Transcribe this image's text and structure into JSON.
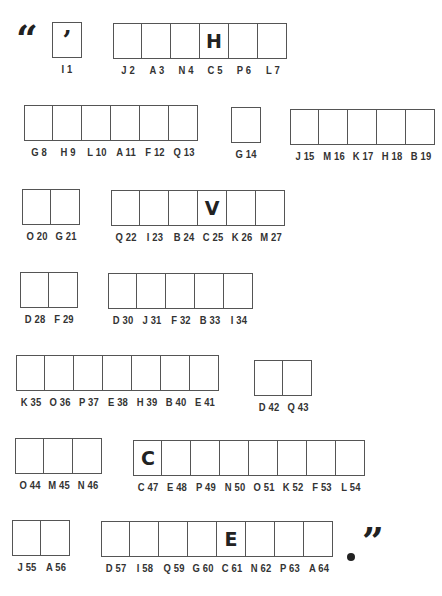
{
  "puzzle": {
    "open_quote": "“",
    "close_quote": "”",
    "end_punct": ".",
    "words": [
      {
        "x": 52,
        "y": 22,
        "cells": [
          {
            "label": "I 1",
            "value": "’",
            "kind": "apos"
          }
        ]
      },
      {
        "x": 113,
        "y": 23,
        "cells": [
          {
            "label": "J 2",
            "value": ""
          },
          {
            "label": "A 3",
            "value": ""
          },
          {
            "label": "N 4",
            "value": ""
          },
          {
            "label": "C 5",
            "value": "H"
          },
          {
            "label": "P 6",
            "value": ""
          },
          {
            "label": "L 7",
            "value": ""
          }
        ]
      },
      {
        "x": 24,
        "y": 105,
        "cells": [
          {
            "label": "G 8",
            "value": ""
          },
          {
            "label": "H 9",
            "value": ""
          },
          {
            "label": "L 10",
            "value": ""
          },
          {
            "label": "A 11",
            "value": ""
          },
          {
            "label": "F 12",
            "value": ""
          },
          {
            "label": "Q 13",
            "value": ""
          }
        ]
      },
      {
        "x": 231,
        "y": 107,
        "cells": [
          {
            "label": "G 14",
            "value": ""
          }
        ]
      },
      {
        "x": 290,
        "y": 109,
        "cells": [
          {
            "label": "J 15",
            "value": ""
          },
          {
            "label": "M 16",
            "value": ""
          },
          {
            "label": "K 17",
            "value": ""
          },
          {
            "label": "H 18",
            "value": ""
          },
          {
            "label": "B 19",
            "value": ""
          }
        ]
      },
      {
        "x": 22,
        "y": 189,
        "cells": [
          {
            "label": "O 20",
            "value": ""
          },
          {
            "label": "G 21",
            "value": ""
          }
        ]
      },
      {
        "x": 111,
        "y": 190,
        "cells": [
          {
            "label": "Q 22",
            "value": ""
          },
          {
            "label": "I 23",
            "value": ""
          },
          {
            "label": "B 24",
            "value": ""
          },
          {
            "label": "C 25",
            "value": "V"
          },
          {
            "label": "K 26",
            "value": ""
          },
          {
            "label": "M 27",
            "value": ""
          }
        ]
      },
      {
        "x": 20,
        "y": 272,
        "cells": [
          {
            "label": "D 28",
            "value": ""
          },
          {
            "label": "F 29",
            "value": ""
          }
        ]
      },
      {
        "x": 108,
        "y": 273,
        "cells": [
          {
            "label": "D 30",
            "value": ""
          },
          {
            "label": "J 31",
            "value": ""
          },
          {
            "label": "F 32",
            "value": ""
          },
          {
            "label": "B 33",
            "value": ""
          },
          {
            "label": "I 34",
            "value": ""
          }
        ]
      },
      {
        "x": 16,
        "y": 355,
        "cells": [
          {
            "label": "K 35",
            "value": ""
          },
          {
            "label": "O 36",
            "value": ""
          },
          {
            "label": "P 37",
            "value": ""
          },
          {
            "label": "E 38",
            "value": ""
          },
          {
            "label": "H 39",
            "value": ""
          },
          {
            "label": "B 40",
            "value": ""
          },
          {
            "label": "E 41",
            "value": ""
          }
        ]
      },
      {
        "x": 254,
        "y": 360,
        "cells": [
          {
            "label": "D 42",
            "value": ""
          },
          {
            "label": "Q 43",
            "value": ""
          }
        ]
      },
      {
        "x": 15,
        "y": 438,
        "cells": [
          {
            "label": "O 44",
            "value": ""
          },
          {
            "label": "M 45",
            "value": ""
          },
          {
            "label": "N 46",
            "value": ""
          }
        ]
      },
      {
        "x": 133,
        "y": 440,
        "cells": [
          {
            "label": "C 47",
            "value": "C"
          },
          {
            "label": "E 48",
            "value": ""
          },
          {
            "label": "P 49",
            "value": ""
          },
          {
            "label": "N 50",
            "value": ""
          },
          {
            "label": "O 51",
            "value": ""
          },
          {
            "label": "K 52",
            "value": ""
          },
          {
            "label": "F 53",
            "value": ""
          },
          {
            "label": "L 54",
            "value": ""
          }
        ]
      },
      {
        "x": 12,
        "y": 520,
        "cells": [
          {
            "label": "J 55",
            "value": ""
          },
          {
            "label": "A 56",
            "value": ""
          }
        ]
      },
      {
        "x": 101,
        "y": 521,
        "cells": [
          {
            "label": "D 57",
            "value": ""
          },
          {
            "label": "I 58",
            "value": ""
          },
          {
            "label": "Q 59",
            "value": ""
          },
          {
            "label": "G 60",
            "value": ""
          },
          {
            "label": "C 61",
            "value": "E"
          },
          {
            "label": "N 62",
            "value": ""
          },
          {
            "label": "P 63",
            "value": ""
          },
          {
            "label": "A 64",
            "value": ""
          }
        ]
      }
    ]
  }
}
